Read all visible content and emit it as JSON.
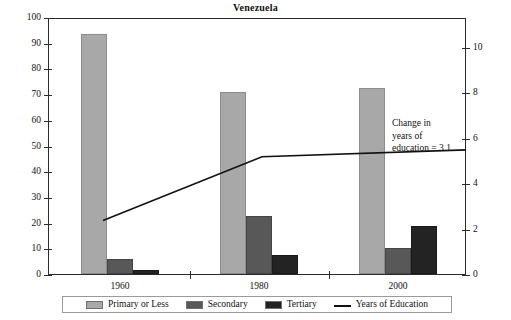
{
  "chart_data": {
    "type": "bar",
    "title": "Venezuela",
    "xlabel": "",
    "ylabel": "",
    "categories": [
      "1960",
      "1980",
      "2000"
    ],
    "series": [
      {
        "name": "Primary or Less",
        "values": [
          93.5,
          71.0,
          72.5
        ],
        "color": "#a8a8a8",
        "axis": "left"
      },
      {
        "name": "Secondary",
        "values": [
          6.0,
          22.5,
          10.0
        ],
        "color": "#585858",
        "axis": "left"
      },
      {
        "name": "Tertiary",
        "values": [
          1.5,
          7.5,
          18.5
        ],
        "color": "#232323",
        "axis": "left"
      },
      {
        "name": "Years of Education",
        "values": [
          2.4,
          5.2,
          5.5
        ],
        "color": "#111111",
        "axis": "right",
        "type": "line"
      }
    ],
    "ylim": [
      0,
      100
    ],
    "yticks": [
      0,
      10,
      20,
      30,
      40,
      50,
      60,
      70,
      80,
      90,
      100
    ],
    "y2lim": [
      0,
      11.3
    ],
    "y2ticks": [
      0,
      2,
      4,
      6,
      8,
      10
    ],
    "grid": false,
    "legend_position": "bottom",
    "annotations": [
      {
        "text": "Change in years of education = 3.1",
        "lines": [
          "Change in",
          "years of",
          "education = 3.1"
        ]
      }
    ]
  },
  "legend": {
    "items": [
      {
        "label": "Primary or Less",
        "marker": "square-swatch"
      },
      {
        "label": "Secondary",
        "marker": "square-swatch"
      },
      {
        "label": "Tertiary",
        "marker": "square-swatch"
      },
      {
        "label": "Years of Education",
        "marker": "line-swatch"
      }
    ]
  },
  "axes": {
    "left_ticks": [
      "0",
      "10",
      "20",
      "30",
      "40",
      "50",
      "60",
      "70",
      "80",
      "90",
      "100"
    ],
    "right_ticks": [
      "0",
      "2",
      "4",
      "6",
      "8",
      "10"
    ],
    "bottom_ticks": [
      "1960",
      "1980",
      "2000"
    ]
  }
}
